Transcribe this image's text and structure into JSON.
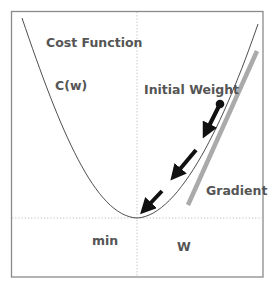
{
  "diagram": {
    "labels": {
      "cost_function": "Cost Function",
      "cost_symbol": "C(w)",
      "initial_weight": "Initial Weight",
      "gradient": "Gradient",
      "min": "min",
      "weight_axis": "W"
    },
    "colors": {
      "border": "#888888",
      "curve": "#333333",
      "gradient_line": "#aaaaaa",
      "arrows": "#111111",
      "dotted_axes": "#bbbbbb",
      "text": "#555555"
    },
    "curve": {
      "type": "parabola",
      "minimum": [
        137,
        218
      ],
      "left_top": [
        22,
        18
      ],
      "right_top": [
        258,
        24
      ]
    },
    "initial_point": [
      220,
      104
    ],
    "steps": [
      {
        "from": [
          220,
          104
        ],
        "to": [
          199,
          145
        ]
      },
      {
        "from": [
          196,
          150
        ],
        "to": [
          166,
          186
        ]
      },
      {
        "from": [
          162,
          191
        ],
        "to": [
          136,
          218
        ]
      }
    ],
    "gradient_line": {
      "from": [
        257,
        51
      ],
      "to": [
        188,
        205
      ]
    }
  }
}
